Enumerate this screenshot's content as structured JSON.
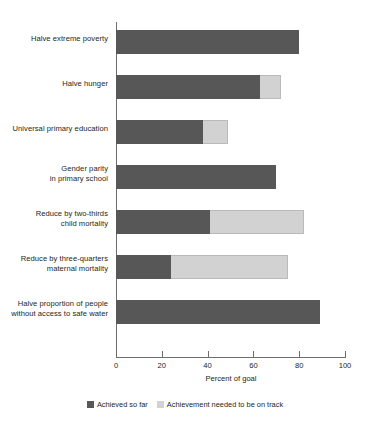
{
  "chart_data": {
    "type": "bar",
    "orientation": "horizontal",
    "stacked": true,
    "title": "",
    "xlabel": "Percent of goal",
    "ylabel": "",
    "xlim": [
      0,
      100
    ],
    "xticks": [
      0,
      20,
      40,
      60,
      80,
      100
    ],
    "xticklabels": [
      "0",
      "20",
      "40",
      "60",
      "80",
      "100"
    ],
    "grid": false,
    "legend_position": "bottom-center",
    "categories": [
      "Halve extreme poverty",
      "Halve hunger",
      "Universal primary education",
      "Gender parity\nin primary school",
      "Reduce by two-thirds\nchild mortality",
      "Reduce by three-quarters\nmaternal mortality",
      "Halve proportion of people\nwithout access to safe water"
    ],
    "series": [
      {
        "name": "Achieved so far",
        "color": "#575757",
        "values": [
          80,
          63,
          38,
          70,
          41,
          24,
          89
        ]
      },
      {
        "name": "Achievement needed to be on track",
        "color": "#d2d2d2",
        "values": [
          0,
          9,
          11,
          0,
          41,
          51,
          0
        ]
      }
    ],
    "totals": [
      80,
      72,
      49,
      70,
      82,
      75,
      89
    ]
  },
  "legend": {
    "items": [
      {
        "label": "Achieved so far",
        "swatch": "dark-gray-swatch"
      },
      {
        "label": "Achievement needed to be on track",
        "swatch": "light-gray-swatch"
      }
    ]
  }
}
